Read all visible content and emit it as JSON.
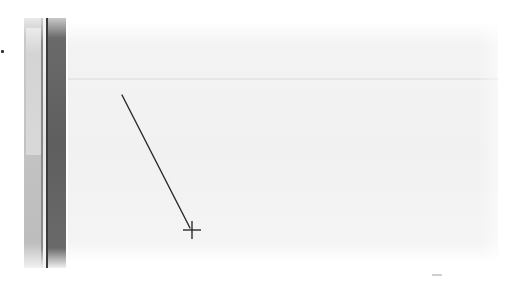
{
  "screen": {
    "width": 515,
    "height": 285,
    "description": "Zoomed/blurred view of a drawing canvas with a line tool in use"
  },
  "left_panel": {
    "scrollbar": {
      "thumb_top_px": 10,
      "thumb_height_px": 127
    }
  },
  "canvas": {
    "background": "#f2f2f2",
    "line": {
      "x1": 122,
      "y1": 95,
      "x2": 190,
      "y2": 228,
      "color": "#2a2a2a",
      "width": 1.4
    },
    "cursor": {
      "type": "crosshair-icon",
      "x": 192,
      "y": 230,
      "arm": 9,
      "color": "#1e1e1e"
    }
  },
  "colors": {
    "dark_bar": "#5e5e5e",
    "scroll_track": "#bdbdbd",
    "scroll_thumb": "#d6d6d6"
  }
}
